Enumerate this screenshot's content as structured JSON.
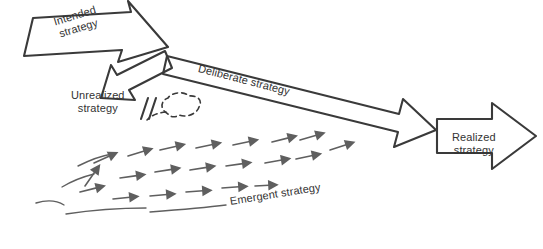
{
  "diagram": {
    "colors": {
      "stroke": "#3a3a3a",
      "text": "#333333",
      "arrow_fill": "#666666",
      "background": "#ffffff"
    },
    "labels": {
      "intended": "Intended\nstrategy",
      "unrealized": "Unrealized\nstrategy",
      "deliberate": "Deliberate strategy",
      "realized": "Realized\nstrategy",
      "emergent": "Emergent strategy"
    }
  }
}
